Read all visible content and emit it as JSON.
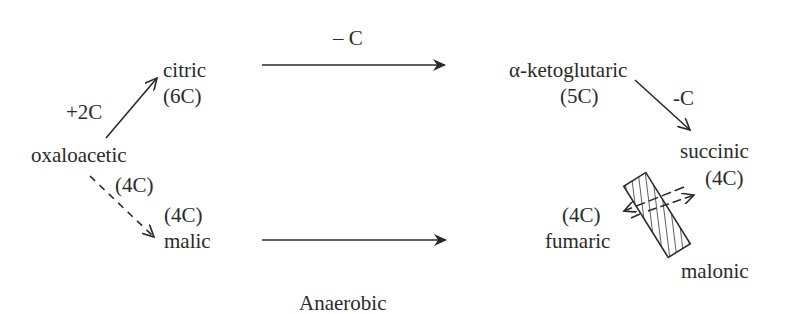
{
  "diagram": {
    "type": "metabolic-pathway",
    "caption": "Anaerobic",
    "nodes": {
      "citric": {
        "name": "citric",
        "carbons": "(6C)"
      },
      "oxaloacetic": {
        "name": "oxaloacetic",
        "carbons": "(4C)"
      },
      "alpha_ketoglutaric": {
        "name": "α-ketoglutaric",
        "carbons": "(5C)"
      },
      "succinic": {
        "name": "succinic",
        "carbons": "(4C)"
      },
      "malic": {
        "name": "malic",
        "carbons": "(4C)"
      },
      "fumaric": {
        "name": "fumaric",
        "carbons": "(4C)"
      },
      "malonic": {
        "name": "malonic"
      }
    },
    "edges": [
      {
        "from": "oxaloacetic",
        "to": "citric",
        "label": "+2C",
        "style": "solid"
      },
      {
        "from": "citric",
        "to": "alpha_ketoglutaric",
        "label": "– C",
        "style": "solid"
      },
      {
        "from": "alpha_ketoglutaric",
        "to": "succinic",
        "label": "-C",
        "style": "solid"
      },
      {
        "from": "oxaloacetic",
        "to": "malic",
        "label": "",
        "style": "dashed"
      },
      {
        "from": "malic",
        "to": "fumaric",
        "label": "",
        "style": "solid"
      },
      {
        "from": "fumaric",
        "to": "succinic",
        "label": "",
        "style": "reversible, blocked by malonic"
      }
    ],
    "edge_labels": {
      "plus_2c": "+2C",
      "minus_c_top": "– C",
      "minus_c_right": "-C"
    },
    "colors": {
      "ink": "#2a2a2a",
      "background": "#ffffff"
    }
  }
}
